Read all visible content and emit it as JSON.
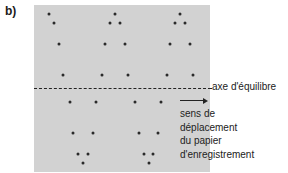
{
  "figure": {
    "panel_label": "b)",
    "axis_label": "axe d'équilibre",
    "direction_text": {
      "line1": "sens de",
      "line2": "déplacement",
      "line3": "du papier",
      "line4": "d'enregistrement"
    },
    "colors": {
      "panel": "#d2d2d2",
      "dots": "#2a2a2a",
      "text": "#222222"
    },
    "dots": [
      [
        49,
        14
      ],
      [
        54,
        23
      ],
      [
        59,
        44
      ],
      [
        63,
        75
      ],
      [
        115,
        14
      ],
      [
        110,
        23
      ],
      [
        120,
        23
      ],
      [
        105,
        44
      ],
      [
        125,
        44
      ],
      [
        102,
        75
      ],
      [
        128,
        75
      ],
      [
        180,
        14
      ],
      [
        175,
        23
      ],
      [
        185,
        23
      ],
      [
        170,
        44
      ],
      [
        190,
        44
      ],
      [
        167,
        75
      ],
      [
        193,
        75
      ],
      [
        70,
        102
      ],
      [
        96,
        102
      ],
      [
        73,
        133
      ],
      [
        93,
        133
      ],
      [
        78,
        154
      ],
      [
        88,
        154
      ],
      [
        83,
        163
      ],
      [
        135,
        102
      ],
      [
        161,
        102
      ],
      [
        139,
        133
      ],
      [
        158,
        133
      ],
      [
        144,
        154
      ],
      [
        153,
        154
      ],
      [
        149,
        163
      ]
    ]
  }
}
